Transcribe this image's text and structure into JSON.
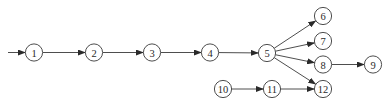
{
  "diagram": {
    "type": "directed-graph",
    "node_radius": 8.6,
    "stroke_color": "#3a3a3a",
    "background": "#ffffff",
    "nodes": [
      {
        "id": "1",
        "label": "1",
        "x": 34,
        "y": 52.5
      },
      {
        "id": "2",
        "label": "2",
        "x": 94,
        "y": 52.5
      },
      {
        "id": "3",
        "label": "3",
        "x": 152,
        "y": 52.5
      },
      {
        "id": "4",
        "label": "4",
        "x": 210,
        "y": 52.5
      },
      {
        "id": "5",
        "label": "5",
        "x": 267,
        "y": 53
      },
      {
        "id": "6",
        "label": "6",
        "x": 323,
        "y": 16
      },
      {
        "id": "7",
        "label": "7",
        "x": 323,
        "y": 41
      },
      {
        "id": "8",
        "label": "8",
        "x": 323,
        "y": 64.5
      },
      {
        "id": "9",
        "label": "9",
        "x": 373,
        "y": 64.5
      },
      {
        "id": "10",
        "label": "10",
        "x": 223,
        "y": 89
      },
      {
        "id": "11",
        "label": "11",
        "x": 272,
        "y": 89
      },
      {
        "id": "12",
        "label": "12",
        "x": 323,
        "y": 89
      }
    ],
    "entry_edge": {
      "from_x": 8,
      "from_y": 52.5,
      "to": "1"
    },
    "edges": [
      {
        "from": "1",
        "to": "2"
      },
      {
        "from": "2",
        "to": "3"
      },
      {
        "from": "3",
        "to": "4"
      },
      {
        "from": "4",
        "to": "5"
      },
      {
        "from": "5",
        "to": "6"
      },
      {
        "from": "5",
        "to": "7"
      },
      {
        "from": "5",
        "to": "8"
      },
      {
        "from": "5",
        "to": "12"
      },
      {
        "from": "8",
        "to": "9"
      },
      {
        "from": "10",
        "to": "11"
      },
      {
        "from": "11",
        "to": "12"
      }
    ]
  }
}
